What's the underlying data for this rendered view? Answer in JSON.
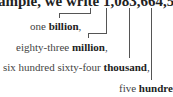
{
  "top_text": "ample, we write 1,083,664,500 an",
  "labels": [
    {
      "prefix": "one ",
      "bold": "billion",
      "suffix": ","
    },
    {
      "prefix": "eighty-three ",
      "bold": "million",
      "suffix": ","
    },
    {
      "prefix": "six hundred sixty-four ",
      "bold": "thousand",
      "suffix": ","
    },
    {
      "prefix": "five ",
      "bold": "hundred",
      "suffix": ""
    }
  ]
}
